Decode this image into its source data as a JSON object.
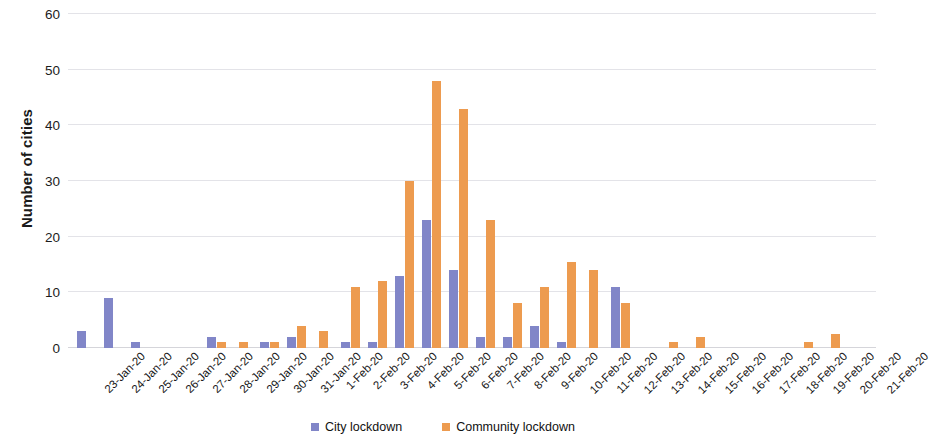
{
  "chart_data": {
    "type": "bar",
    "title": "",
    "xlabel": "",
    "ylabel": "Number of cities",
    "ylim": [
      0,
      60
    ],
    "yticks": [
      0,
      10,
      20,
      30,
      40,
      50,
      60
    ],
    "grid": true,
    "legend_position": "bottom",
    "categories": [
      "23-Jan-20",
      "24-Jan-20",
      "25-Jan-20",
      "26-Jan-20",
      "27-Jan-20",
      "28-Jan-20",
      "29-Jan-20",
      "30-Jan-20",
      "31-Jan-20",
      "1-Feb-20",
      "2-Feb-20",
      "3-Feb-20",
      "4-Feb-20",
      "5-Feb-20",
      "6-Feb-20",
      "7-Feb-20",
      "8-Feb-20",
      "9-Feb-20",
      "10-Feb-20",
      "11-Feb-20",
      "12-Feb-20",
      "13-Feb-20",
      "14-Feb-20",
      "15-Feb-20",
      "16-Feb-20",
      "17-Feb-20",
      "18-Feb-20",
      "19-Feb-20",
      "20-Feb-20",
      "21-Feb-20"
    ],
    "series": [
      {
        "name": "City lockdown",
        "color": "#8186c8",
        "values": [
          3,
          9,
          1,
          0,
          0,
          2,
          0,
          1,
          2,
          0,
          1,
          1,
          13,
          23,
          14,
          2,
          2,
          4,
          1,
          0,
          11,
          0,
          0,
          0,
          0,
          0,
          0,
          0,
          0,
          0
        ]
      },
      {
        "name": "Community lockdown",
        "color": "#ed9b4f",
        "values": [
          0,
          0,
          0,
          0,
          0,
          1,
          1,
          1,
          4,
          3,
          11,
          12,
          30,
          48,
          43,
          23,
          8,
          11,
          15.5,
          14,
          8,
          0,
          1,
          2,
          0,
          0,
          0,
          1,
          2.5,
          0
        ]
      }
    ]
  },
  "legend": {
    "items": [
      {
        "label": "City lockdown",
        "color": "#8186c8"
      },
      {
        "label": "Community lockdown",
        "color": "#ed9b4f"
      }
    ]
  },
  "axis": {
    "y_title": "Number of cities"
  }
}
